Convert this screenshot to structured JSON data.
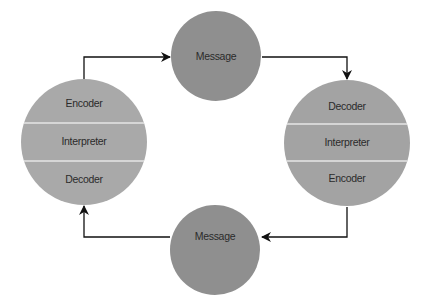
{
  "diagram": {
    "type": "communication-cycle",
    "colors": {
      "background": "#ffffff",
      "sender_receiver_left": "#a9a9a9",
      "sender_receiver_right": "#a3a3a3",
      "message": "#8f8f8f",
      "separator": "#e6e6e6",
      "arrow": "#111111",
      "text": "#2b2b2b"
    },
    "nodes": {
      "left": {
        "sections": [
          "Encoder",
          "Interpreter",
          "Decoder"
        ]
      },
      "top_message": {
        "label": "Message"
      },
      "right": {
        "sections": [
          "Decoder",
          "Interpreter",
          "Encoder"
        ]
      },
      "bottom_message": {
        "label": "Message"
      }
    },
    "edges": [
      {
        "from": "left",
        "to": "top_message"
      },
      {
        "from": "top_message",
        "to": "right"
      },
      {
        "from": "right",
        "to": "bottom_message"
      },
      {
        "from": "bottom_message",
        "to": "left"
      }
    ]
  }
}
